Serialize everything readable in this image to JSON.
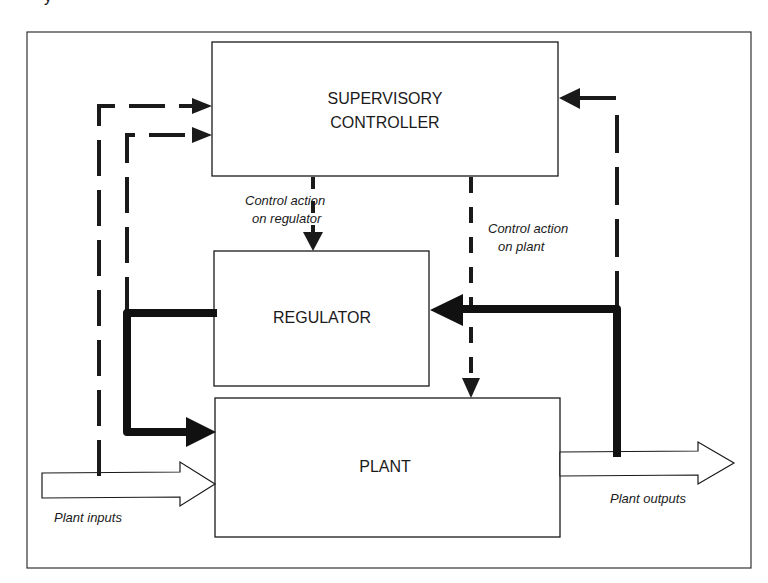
{
  "diagram": {
    "type": "block-diagram",
    "title_fragment": "y",
    "colors": {
      "line": "#1a1a1a",
      "background": "#ffffff"
    },
    "blocks": [
      {
        "id": "supervisory",
        "label_lines": [
          "SUPERVISORY",
          "CONTROLLER"
        ]
      },
      {
        "id": "regulator",
        "label_lines": [
          "REGULATOR"
        ]
      },
      {
        "id": "plant",
        "label_lines": [
          "PLANT"
        ]
      }
    ],
    "annotations": {
      "control_on_regulator": [
        "Control action",
        "on regulator"
      ],
      "control_on_plant": [
        "Control action",
        "on plant"
      ],
      "plant_inputs": "Plant inputs",
      "plant_outputs": "Plant outputs"
    },
    "connections": [
      {
        "from": "plant_inputs",
        "to": "supervisory",
        "style": "dashed"
      },
      {
        "from": "regulator",
        "to": "supervisory",
        "style": "dashed"
      },
      {
        "from": "plant_outputs",
        "to": "supervisory",
        "style": "dashed"
      },
      {
        "from": "supervisory",
        "to": "regulator",
        "style": "dashed",
        "label": "Control action on regulator"
      },
      {
        "from": "supervisory",
        "to": "plant",
        "style": "dashed",
        "label": "Control action on plant"
      },
      {
        "from": "regulator",
        "to": "plant",
        "style": "thick"
      },
      {
        "from": "plant_outputs",
        "to": "regulator",
        "style": "thick"
      },
      {
        "from": "plant_inputs",
        "to": "plant",
        "style": "hollow-arrow"
      },
      {
        "from": "plant",
        "to": "plant_outputs",
        "style": "hollow-arrow"
      }
    ]
  }
}
